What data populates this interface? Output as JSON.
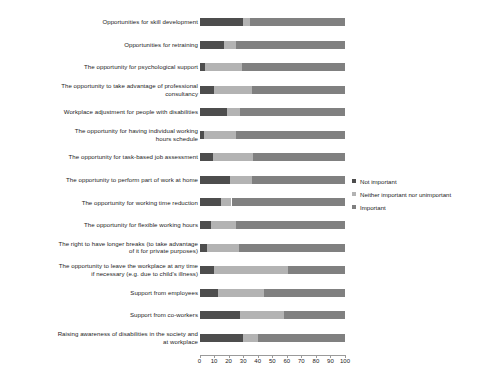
{
  "chart_data": {
    "type": "bar",
    "orientation": "horizontal",
    "stacked": true,
    "stacked_percent": true,
    "title": "",
    "xlabel": "",
    "ylabel": "",
    "xlim": [
      0,
      100
    ],
    "grid": false,
    "legend_position": "right-middle",
    "legend": [
      {
        "label": "Not important",
        "color": "#4d4d4d"
      },
      {
        "label": "Neither important nor unimportant",
        "color": "#b3b3b3"
      },
      {
        "label": "Important",
        "color": "#808080"
      }
    ],
    "xticks": [
      0,
      10,
      20,
      30,
      40,
      50,
      60,
      70,
      80,
      90,
      100
    ],
    "xticklabels": [
      "0",
      "10",
      "20",
      "30",
      "40",
      "50",
      "60",
      "70",
      "80",
      "90",
      "100"
    ],
    "categories": [
      "Opportunities for skill development",
      "Opportunities for retraining",
      "The opportunity for psychological support",
      "The opportunity to take advantage of professional\nconsultancy",
      "Workplace adjustment for people with disabilities",
      "The opportunity for having individual working\nhours schedule",
      "The opportunity for task-based job assessment",
      "The opportunity to perform part of work at home",
      "The opportunity for working time reduction",
      "The opportunity for flexible working hours",
      "The right to have longer breaks (to take advantage\nof it for private purposes)",
      "The opportunity to leave the workplace at any time\nif necessary (e.g. due to child's illness)",
      "Support from employees",
      "Support from co-workers",
      "Raising awareness of disabilities in the society and\nat workplace"
    ],
    "series": [
      {
        "name": "Not important",
        "color": "#4d4d4d",
        "values": [
          30,
          17,
          4,
          10,
          19,
          3,
          9,
          21,
          15,
          8,
          5,
          10,
          13,
          28,
          30
        ]
      },
      {
        "name": "Neither important nor unimportant",
        "color": "#b3b3b3",
        "values": [
          5,
          8,
          25,
          26,
          9,
          22,
          28,
          15,
          7,
          17,
          22,
          51,
          31,
          30,
          10
        ]
      },
      {
        "name": "Important",
        "color": "#808080",
        "values": [
          65,
          75,
          71,
          64,
          72,
          75,
          63,
          64,
          78,
          75,
          73,
          39,
          56,
          42,
          60
        ]
      }
    ]
  }
}
